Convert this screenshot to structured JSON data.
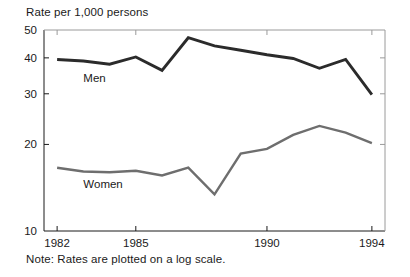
{
  "chart_data": {
    "type": "line",
    "title": "",
    "ylabel": "Rate per 1,000 persons",
    "xlabel": "",
    "note": "Note: Rates are plotted on a log scale.",
    "scale": "log",
    "grid": false,
    "legend_position": "inline-labels",
    "x": [
      1982,
      1983,
      1984,
      1985,
      1986,
      1987,
      1988,
      1989,
      1990,
      1991,
      1992,
      1993,
      1994
    ],
    "xlim": [
      1981.5,
      1994.5
    ],
    "ylim": [
      10,
      50
    ],
    "yticks": [
      10,
      20,
      30,
      40,
      50
    ],
    "ytick_labels": [
      "10",
      "20",
      "30",
      "40",
      "50"
    ],
    "xticks": [
      1982,
      1985,
      1990,
      1994
    ],
    "xtick_labels": [
      "1982",
      "1985",
      "1990",
      "1994"
    ],
    "series": [
      {
        "name": "Men",
        "color": "#2b2b2b",
        "width": 2.9,
        "label_x": 1983.0,
        "label_y": 33.0,
        "values": [
          39.5,
          39.0,
          38.0,
          40.3,
          36.2,
          47.0,
          44.0,
          42.5,
          41.0,
          39.8,
          36.8,
          39.5,
          29.8
        ]
      },
      {
        "name": "Women",
        "color": "#6e6e6e",
        "width": 2.4,
        "label_x": 1983.0,
        "label_y": 14.1,
        "values": [
          16.6,
          16.1,
          16.0,
          16.2,
          15.6,
          16.6,
          13.4,
          18.6,
          19.3,
          21.6,
          23.2,
          22.0,
          20.2
        ]
      }
    ]
  }
}
